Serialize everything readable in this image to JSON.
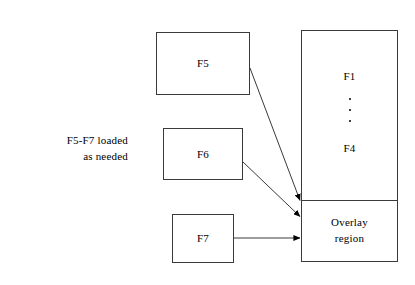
{
  "diagram": {
    "background_color": "#ffffff",
    "line_color": "#3a3a3a",
    "text_color": "#000000",
    "caption": {
      "line1": "F5-F7 loaded",
      "line2": "as needed"
    },
    "boxes": [
      {
        "id": "f5",
        "label": "F5"
      },
      {
        "id": "f6",
        "label": "F6"
      },
      {
        "id": "f7",
        "label": "F7"
      }
    ],
    "memory": {
      "resident": {
        "top_label": "F1",
        "bottom_label": "F4",
        "dots": 3
      },
      "overlay": {
        "line1": "Overlay",
        "line2": "region"
      }
    },
    "arrows": [
      {
        "from": "f5",
        "to": "overlay-region"
      },
      {
        "from": "f6",
        "to": "overlay-region"
      },
      {
        "from": "f7",
        "to": "overlay-region"
      }
    ]
  }
}
